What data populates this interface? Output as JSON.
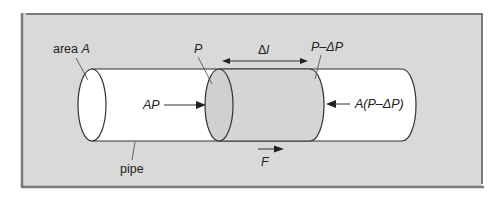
{
  "figure": {
    "labels": {
      "area": "area ",
      "area_var": "A",
      "pipe": "pipe",
      "p_left": "P",
      "delta_l_prefix": "Δ",
      "delta_l_var": "l",
      "p_right": "P–ΔP",
      "force_left": "AP",
      "force_right": "A(P–ΔP)",
      "net_force": "F"
    },
    "colors": {
      "background": "#d9d9d9",
      "frame": "#7a7a7a",
      "pipe_fill": "#ffffff",
      "fluid_segment": "#d6d6d6",
      "stroke": "#333333"
    }
  }
}
